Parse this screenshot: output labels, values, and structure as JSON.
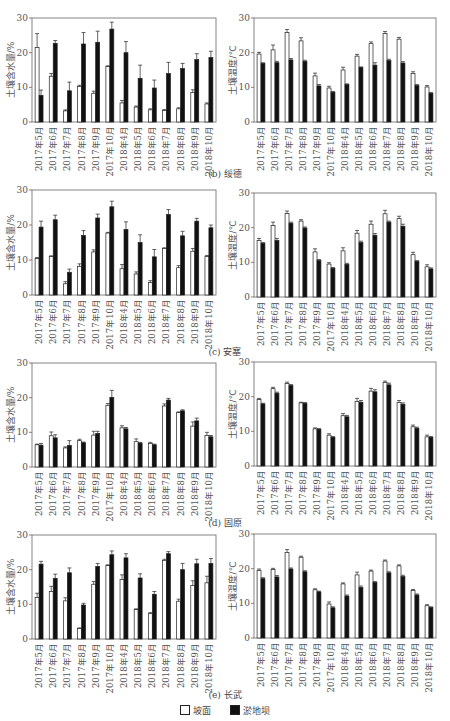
{
  "months": [
    "2017年5月",
    "2017年6月",
    "2017年7月",
    "2017年8月",
    "2017年9月",
    "2017年10月",
    "2018年4月",
    "2018年5月",
    "2018年6月",
    "2018年7月",
    "2018年8月",
    "2018年9月",
    "2018年10月"
  ],
  "captions": {
    "b": "(b) 绥德",
    "c": "(c) 安塞",
    "d": "(d) 固原",
    "e": "(e) 长武"
  },
  "legend": {
    "slope": "坡面",
    "dam": "淤地坝",
    "slope_color": "#ffffff",
    "dam_color": "#111111"
  },
  "chart_data": [
    {
      "id": "b-moisture",
      "panel": "(b) 绥德",
      "type": "bar",
      "ylabel": "土壤含水量/%",
      "ylim": [
        0,
        30
      ],
      "yticks": [
        0,
        10,
        20,
        30
      ],
      "categories": [
        "2017年5月",
        "2017年6月",
        "2017年7月",
        "2017年8月",
        "2017年9月",
        "2017年10月",
        "2018年4月",
        "2018年5月",
        "2018年6月",
        "2018年7月",
        "2018年8月",
        "2018年9月",
        "2018年10月"
      ],
      "series": [
        {
          "name": "坡面",
          "values": [
            21.5,
            13.2,
            3.2,
            10.2,
            8.3,
            16.0,
            5.5,
            4.3,
            3.5,
            3.3,
            3.8,
            8.5,
            5.2
          ],
          "err": [
            4.0,
            0.8,
            0.3,
            0.4,
            0.6,
            0.2,
            0.7,
            0.3,
            0.3,
            0.3,
            0.3,
            0.8,
            0.3
          ]
        },
        {
          "name": "淤地坝",
          "values": [
            7.7,
            22.7,
            9.0,
            22.5,
            23.0,
            26.8,
            20.0,
            12.6,
            9.8,
            14.0,
            15.4,
            18.0,
            18.6
          ],
          "err": [
            1.5,
            0.8,
            2.5,
            3.3,
            3.2,
            2.0,
            3.2,
            3.8,
            2.3,
            3.2,
            1.5,
            1.7,
            1.8
          ]
        }
      ]
    },
    {
      "id": "b-temperature",
      "panel": "(b) 绥德",
      "type": "bar",
      "ylabel": "土壤温度/℃",
      "ylim": [
        0,
        30
      ],
      "yticks": [
        0,
        10,
        20,
        30
      ],
      "categories": [
        "2017年5月",
        "2017年6月",
        "2017年7月",
        "2017年8月",
        "2017年9月",
        "2017年10月",
        "2018年4月",
        "2018年5月",
        "2018年6月",
        "2018年7月",
        "2018年8月",
        "2018年9月",
        "2018年10月"
      ],
      "series": [
        {
          "name": "坡面",
          "values": [
            19.6,
            20.8,
            25.8,
            23.4,
            13.3,
            9.8,
            15.0,
            19.0,
            22.6,
            25.5,
            23.9,
            14.0,
            10.1
          ],
          "err": [
            0.5,
            1.4,
            0.9,
            0.9,
            0.8,
            0.5,
            0.8,
            0.5,
            0.5,
            0.6,
            0.5,
            0.5,
            0.4
          ]
        },
        {
          "name": "淤地坝",
          "values": [
            16.9,
            17.1,
            17.9,
            17.5,
            10.4,
            8.6,
            10.8,
            15.7,
            16.4,
            17.7,
            17.0,
            10.5,
            8.3
          ],
          "err": [
            0.2,
            0.4,
            0.4,
            0.3,
            0.4,
            0.2,
            0.2,
            0.2,
            0.7,
            0.4,
            0.4,
            0.3,
            0.2
          ]
        }
      ]
    },
    {
      "id": "c-moisture",
      "panel": "(c) 安塞",
      "type": "bar",
      "ylabel": "土壤含水量/%",
      "ylim": [
        0,
        30
      ],
      "yticks": [
        0,
        10,
        20,
        30
      ],
      "categories": [
        "2017年5月",
        "2017年6月",
        "2017年7月",
        "2017年8月",
        "2017年9月",
        "2017年10月",
        "2018年4月",
        "2018年5月",
        "2018年6月",
        "2018年7月",
        "2018年8月",
        "2018年9月",
        "2018年10月"
      ],
      "series": [
        {
          "name": "坡面",
          "values": [
            10.4,
            11.0,
            3.2,
            8.2,
            12.3,
            17.7,
            7.5,
            6.0,
            3.6,
            13.3,
            7.8,
            12.5,
            11.0
          ],
          "err": [
            0.3,
            0.2,
            0.6,
            0.7,
            0.6,
            0.2,
            1.2,
            0.6,
            0.5,
            0.2,
            0.6,
            0.8,
            0.3
          ]
        },
        {
          "name": "淤地坝",
          "values": [
            19.4,
            21.5,
            6.5,
            17.0,
            22.0,
            25.2,
            18.7,
            15.0,
            10.9,
            23.0,
            16.9,
            21.1,
            19.2
          ],
          "err": [
            1.7,
            1.3,
            0.9,
            1.4,
            1.1,
            1.6,
            2.2,
            2.2,
            2.1,
            1.4,
            1.3,
            0.8,
            0.8
          ]
        }
      ]
    },
    {
      "id": "c-temperature",
      "panel": "(c) 安塞",
      "type": "bar",
      "ylabel": "土壤温度/℃",
      "ylim": [
        0,
        30
      ],
      "yticks": [
        0,
        10,
        20,
        30
      ],
      "categories": [
        "2017年5月",
        "2017年6月",
        "2017年7月",
        "2017年8月",
        "2017年9月",
        "2017年10月",
        "2018年4月",
        "2018年5月",
        "2018年6月",
        "2018年7月",
        "2018年8月",
        "2018年9月",
        "2018年10月"
      ],
      "series": [
        {
          "name": "坡面",
          "values": [
            16.3,
            20.6,
            24.1,
            21.9,
            13.0,
            9.5,
            13.3,
            18.4,
            21.0,
            24.0,
            22.6,
            12.2,
            8.7
          ],
          "err": [
            0.6,
            1.0,
            0.7,
            0.4,
            0.9,
            0.4,
            0.9,
            0.8,
            0.9,
            1.0,
            0.7,
            0.7,
            0.6
          ]
        },
        {
          "name": "淤地坝",
          "values": [
            15.5,
            16.3,
            21.3,
            19.9,
            10.5,
            8.3,
            9.4,
            15.7,
            17.8,
            21.6,
            20.4,
            10.3,
            8.1
          ],
          "err": [
            0.2,
            0.6,
            0.3,
            0.3,
            0.3,
            0.2,
            0.3,
            0.4,
            0.5,
            0.3,
            0.6,
            0.2,
            0.3
          ]
        }
      ]
    },
    {
      "id": "d-moisture",
      "panel": "(d) 固原",
      "type": "bar",
      "ylabel": "土壤含水量/%",
      "ylim": [
        0,
        30
      ],
      "yticks": [
        0,
        10,
        20,
        30
      ],
      "categories": [
        "2017年5月",
        "2017年6月",
        "2017年7月",
        "2017年8月",
        "2017年9月",
        "2017年10月",
        "2018年4月",
        "2018年5月",
        "2018年6月",
        "2018年7月",
        "2018年8月",
        "2018年9月",
        "2018年10月"
      ],
      "series": [
        {
          "name": "坡面",
          "values": [
            6.4,
            9.0,
            5.5,
            7.6,
            9.2,
            17.8,
            11.3,
            7.3,
            6.8,
            17.6,
            15.7,
            11.8,
            9.1
          ],
          "err": [
            0.2,
            1.1,
            0.3,
            0.4,
            1.1,
            0.5,
            0.6,
            0.8,
            0.3,
            0.6,
            0.2,
            1.2,
            0.9
          ]
        },
        {
          "name": "淤地坝",
          "values": [
            6.3,
            8.4,
            6.2,
            7.0,
            9.7,
            20.1,
            11.0,
            6.9,
            6.4,
            19.3,
            16.2,
            13.3,
            8.7
          ],
          "err": [
            0.5,
            0.9,
            1.4,
            0.2,
            0.6,
            2.0,
            0.4,
            0.2,
            0.2,
            0.5,
            0.3,
            0.8,
            0.4
          ]
        }
      ]
    },
    {
      "id": "d-temperature",
      "panel": "(d) 固原",
      "type": "bar",
      "ylabel": "土壤温度/℃",
      "ylim": [
        0,
        30
      ],
      "yticks": [
        0,
        10,
        20,
        30
      ],
      "categories": [
        "2017年5月",
        "2017年6月",
        "2017年7月",
        "2017年8月",
        "2017年9月",
        "2017年10月",
        "2018年4月",
        "2018年5月",
        "2018年6月",
        "2018年7月",
        "2018年8月",
        "2018年9月",
        "2018年10月"
      ],
      "series": [
        {
          "name": "坡面",
          "values": [
            19.2,
            22.3,
            23.8,
            18.2,
            10.7,
            8.9,
            14.5,
            18.6,
            21.6,
            24.1,
            18.3,
            11.3,
            8.4
          ],
          "err": [
            0.3,
            0.4,
            0.4,
            0.2,
            0.3,
            0.4,
            0.6,
            0.9,
            0.8,
            0.4,
            0.6,
            0.5,
            0.5
          ]
        },
        {
          "name": "淤地坝",
          "values": [
            17.9,
            21.0,
            23.2,
            18.1,
            10.6,
            8.3,
            14.2,
            18.4,
            21.4,
            23.4,
            17.8,
            10.9,
            8.3
          ],
          "err": [
            0.2,
            0.3,
            0.3,
            0.2,
            0.2,
            0.2,
            0.4,
            0.5,
            0.6,
            0.5,
            0.4,
            0.3,
            0.2
          ]
        }
      ]
    },
    {
      "id": "e-moisture",
      "panel": "(e) 长武",
      "type": "bar",
      "ylabel": "土壤含水量/%",
      "ylim": [
        0,
        30
      ],
      "yticks": [
        0,
        10,
        20,
        30
      ],
      "categories": [
        "2017年5月",
        "2017年6月",
        "2017年7月",
        "2017年8月",
        "2017年9月",
        "2017年10月",
        "2018年4月",
        "2018年5月",
        "2018年6月",
        "2018年7月",
        "2018年8月",
        "2018年9月",
        "2018年10月"
      ],
      "series": [
        {
          "name": "坡面",
          "values": [
            12.0,
            13.7,
            11.0,
            3.0,
            15.8,
            21.2,
            17.2,
            8.5,
            7.3,
            22.7,
            10.9,
            15.4,
            16.2
          ],
          "err": [
            1.2,
            1.5,
            0.9,
            0.2,
            0.8,
            0.2,
            1.3,
            0.2,
            0.3,
            0.3,
            0.6,
            1.4,
            1.9
          ]
        },
        {
          "name": "淤地坝",
          "values": [
            21.6,
            17.5,
            19.1,
            9.8,
            20.9,
            24.3,
            23.4,
            17.6,
            12.9,
            24.6,
            20.0,
            21.7,
            21.8
          ],
          "err": [
            0.8,
            1.2,
            1.4,
            0.5,
            0.9,
            1.1,
            1.2,
            1.2,
            0.8,
            0.6,
            1.8,
            1.3,
            1.4
          ]
        }
      ]
    },
    {
      "id": "e-temperature",
      "panel": "(e) 长武",
      "type": "bar",
      "ylabel": "土壤温度/℃",
      "ylim": [
        0,
        30
      ],
      "yticks": [
        0,
        10,
        20,
        30
      ],
      "categories": [
        "2017年5月",
        "2017年6月",
        "2017年7月",
        "2017年8月",
        "2017年9月",
        "2017年10月",
        "2018年4月",
        "2018年5月",
        "2018年6月",
        "2018年7月",
        "2018年8月",
        "2018年9月",
        "2018年10月"
      ],
      "series": [
        {
          "name": "坡面",
          "values": [
            19.5,
            19.8,
            24.7,
            23.3,
            13.9,
            9.8,
            15.6,
            18.2,
            19.3,
            22.2,
            20.8,
            13.7,
            9.3
          ],
          "err": [
            0.4,
            0.3,
            0.8,
            0.3,
            0.3,
            0.6,
            0.3,
            0.8,
            0.3,
            0.3,
            0.3,
            0.3,
            0.3
          ]
        },
        {
          "name": "淤地坝",
          "values": [
            17.1,
            17.6,
            19.9,
            19.1,
            13.3,
            8.7,
            12.1,
            14.6,
            16.0,
            18.8,
            17.7,
            12.4,
            8.8
          ],
          "err": [
            0.3,
            0.4,
            0.3,
            0.3,
            0.2,
            0.3,
            0.3,
            0.4,
            0.3,
            0.3,
            0.4,
            0.3,
            0.2
          ]
        }
      ]
    }
  ],
  "layout": {
    "frames": [
      {
        "x": 32,
        "y": 18,
        "w": 184,
        "h": 104
      },
      {
        "x": 254,
        "y": 18,
        "w": 182,
        "h": 104
      },
      {
        "x": 32,
        "y": 190,
        "w": 184,
        "h": 105
      },
      {
        "x": 254,
        "y": 193,
        "w": 182,
        "h": 104
      },
      {
        "x": 32,
        "y": 363,
        "w": 184,
        "h": 104
      },
      {
        "x": 254,
        "y": 362,
        "w": 182,
        "h": 104
      },
      {
        "x": 32,
        "y": 535,
        "w": 184,
        "h": 104
      },
      {
        "x": 254,
        "y": 534,
        "w": 182,
        "h": 104
      }
    ],
    "caption_y": {
      "b": 167,
      "c": 345,
      "d": 516,
      "e": 688
    }
  }
}
